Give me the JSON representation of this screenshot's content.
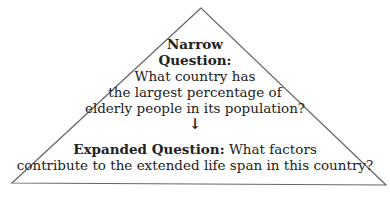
{
  "diagram": {
    "narrow": {
      "label_line1": "Narrow",
      "label_line2": "Question:",
      "lines": [
        "What country has",
        "the largest percentage of",
        "elderly people in its population?"
      ]
    },
    "arrow": "↓",
    "expanded": {
      "label": "Expanded Question:",
      "line1_rest": " What factors",
      "line2": "contribute to the extended life span in this country?"
    },
    "colors": {
      "stroke": "#555555",
      "text": "#222222"
    }
  }
}
